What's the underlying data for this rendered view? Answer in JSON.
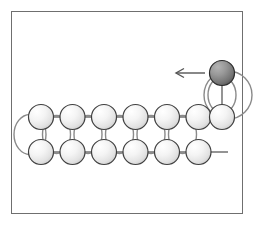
{
  "figure": {
    "title": "",
    "frame": {
      "x": 11,
      "y": 11,
      "width": 232,
      "height": 203,
      "stroke": "#6f6f6f",
      "fill": "#ffffff"
    },
    "colors": {
      "bead_light_highlight": "#ffffff",
      "bead_light_mid": "#f0f0f0",
      "bead_light_edge": "#d2d2d2",
      "bead_light_stroke": "#3f3f3f",
      "bead_dark_highlight": "#a8a8a8",
      "bead_dark_mid": "#8a8a8a",
      "bead_dark_edge": "#5a5a5a",
      "bead_dark_stroke": "#2a2a2a",
      "link_stroke": "#7a7a7a",
      "loop_stroke": "#8a8a8a",
      "arrow_stroke": "#555555",
      "background": "#ffffff"
    },
    "geometry": {
      "bead_radius": 12.5,
      "bead_spacing": 31.5,
      "top_row_y": 117,
      "bottom_row_y": 152,
      "moving_bead_y": 73,
      "top_row_count": 7,
      "bottom_row_count": 6,
      "first_bead_x": 41
    }
  },
  "chart_data": {
    "type": "diagram",
    "title": "",
    "beads_top": [
      {
        "index": 0,
        "cx": 41,
        "cy": 117,
        "shade": "light"
      },
      {
        "index": 1,
        "cx": 72.5,
        "cy": 117,
        "shade": "light"
      },
      {
        "index": 2,
        "cx": 104,
        "cy": 117,
        "shade": "light"
      },
      {
        "index": 3,
        "cx": 135.5,
        "cy": 117,
        "shade": "light"
      },
      {
        "index": 4,
        "cx": 167,
        "cy": 117,
        "shade": "light"
      },
      {
        "index": 5,
        "cx": 198.5,
        "cy": 117,
        "shade": "light"
      },
      {
        "index": 6,
        "cx": 222,
        "cy": 117,
        "shade": "light"
      }
    ],
    "beads_bottom": [
      {
        "index": 0,
        "cx": 41,
        "cy": 152,
        "shade": "light"
      },
      {
        "index": 1,
        "cx": 72.5,
        "cy": 152,
        "shade": "light"
      },
      {
        "index": 2,
        "cx": 104,
        "cy": 152,
        "shade": "light"
      },
      {
        "index": 3,
        "cx": 135.5,
        "cy": 152,
        "shade": "light"
      },
      {
        "index": 4,
        "cx": 167,
        "cy": 152,
        "shade": "light"
      },
      {
        "index": 5,
        "cx": 198.5,
        "cy": 152,
        "shade": "light"
      }
    ],
    "moving_bead": {
      "cx": 222,
      "cy": 73,
      "shade": "dark"
    },
    "arrow": {
      "x1": 205,
      "y1": 73,
      "x2": 176,
      "y2": 73,
      "direction": "left"
    },
    "loops": [
      {
        "name": "left-end-loop",
        "cx": 30,
        "cy": 134.5,
        "rx": 16,
        "ry": 20
      },
      {
        "name": "inter-row-loop-1",
        "cx": 56.5,
        "cy": 134.5,
        "rx": 14,
        "ry": 19
      },
      {
        "name": "inter-row-loop-2",
        "cx": 88,
        "cy": 134.5,
        "rx": 14,
        "ry": 19
      },
      {
        "name": "inter-row-loop-3",
        "cx": 119.5,
        "cy": 134.5,
        "rx": 14,
        "ry": 19
      },
      {
        "name": "inter-row-loop-4",
        "cx": 151,
        "cy": 134.5,
        "rx": 14,
        "ry": 19
      },
      {
        "name": "inter-row-loop-5",
        "cx": 182.5,
        "cy": 134.5,
        "rx": 14,
        "ry": 19
      },
      {
        "name": "moving-bead-loop",
        "cx": 222,
        "cy": 95,
        "rx": 14,
        "ry": 18
      },
      {
        "name": "right-outer-arc",
        "cx": 228,
        "cy": 95,
        "rx": 24,
        "ry": 24
      }
    ],
    "links": [
      {
        "name": "top-link-0",
        "x1": 41,
        "y1": 117,
        "x2": 72.5,
        "y2": 117
      },
      {
        "name": "top-link-1",
        "x1": 72.5,
        "y1": 117,
        "x2": 104,
        "y2": 117
      },
      {
        "name": "top-link-2",
        "x1": 104,
        "y1": 117,
        "x2": 135.5,
        "y2": 117
      },
      {
        "name": "top-link-3",
        "x1": 135.5,
        "y1": 117,
        "x2": 167,
        "y2": 117
      },
      {
        "name": "top-link-4",
        "x1": 167,
        "y1": 117,
        "x2": 198.5,
        "y2": 117
      },
      {
        "name": "top-link-5",
        "x1": 198.5,
        "y1": 117,
        "x2": 222,
        "y2": 117
      },
      {
        "name": "bottom-link-0",
        "x1": 41,
        "y1": 152,
        "x2": 72.5,
        "y2": 152
      },
      {
        "name": "bottom-link-1",
        "x1": 72.5,
        "y1": 152,
        "x2": 104,
        "y2": 152
      },
      {
        "name": "bottom-link-2",
        "x1": 104,
        "y1": 152,
        "x2": 135.5,
        "y2": 152
      },
      {
        "name": "bottom-link-3",
        "x1": 135.5,
        "y1": 152,
        "x2": 167,
        "y2": 152
      },
      {
        "name": "bottom-link-4",
        "x1": 167,
        "y1": 152,
        "x2": 198.5,
        "y2": 152
      },
      {
        "name": "bottom-tail",
        "x1": 198.5,
        "y1": 152,
        "x2": 228,
        "y2": 152
      }
    ]
  }
}
